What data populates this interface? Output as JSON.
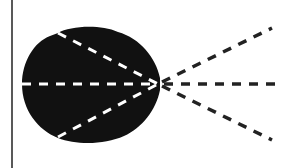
{
  "diagram": {
    "width": 282,
    "height": 168,
    "background": "#ffffff",
    "colors": {
      "ink": "#111111",
      "inner_dash": "#ffffff",
      "outer_dash": "#222222"
    },
    "left_border_line": {
      "x": 12,
      "y1": 0,
      "y2": 168
    },
    "blob": {
      "shape": "two-lobed-dark-silhouette",
      "bounds": {
        "x": 22,
        "y": 28,
        "width": 136,
        "height": 114
      }
    },
    "convergence_point": {
      "x": 158,
      "y": 84
    },
    "inner_rays": [
      {
        "from": [
          58,
          33
        ],
        "to": [
          158,
          84
        ]
      },
      {
        "from": [
          22,
          84
        ],
        "to": [
          158,
          84
        ]
      },
      {
        "from": [
          58,
          137
        ],
        "to": [
          158,
          84
        ]
      }
    ],
    "outer_rays": [
      {
        "from": [
          158,
          84
        ],
        "to": [
          272,
          28
        ]
      },
      {
        "from": [
          158,
          84
        ],
        "to": [
          282,
          84
        ]
      },
      {
        "from": [
          158,
          84
        ],
        "to": [
          272,
          140
        ]
      }
    ]
  }
}
